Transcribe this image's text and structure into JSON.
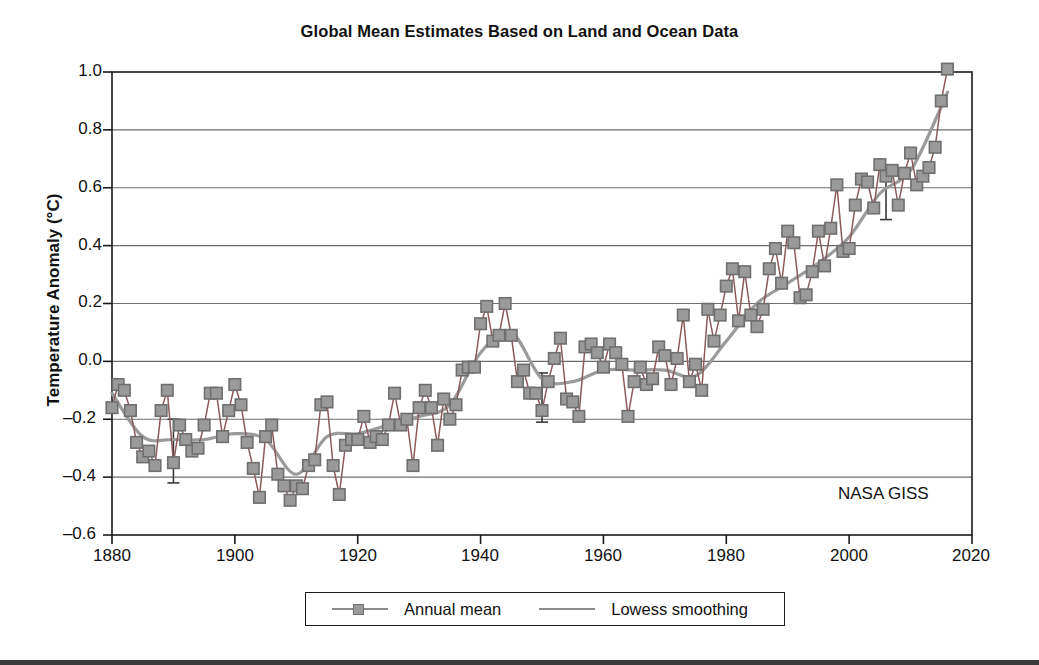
{
  "chart_data": {
    "type": "line",
    "title": "Global Mean Estimates Based on Land and Ocean Data",
    "xlabel": "",
    "ylabel": "Temperature Anomaly (°C)",
    "xlim": [
      1880,
      2020
    ],
    "ylim": [
      -0.6,
      1.0
    ],
    "xticks": [
      1880,
      1900,
      1920,
      1940,
      1960,
      1980,
      2000,
      2020
    ],
    "yticks": [
      -0.6,
      -0.4,
      -0.2,
      0.0,
      0.2,
      0.4,
      0.6,
      0.8,
      1.0
    ],
    "grid": "horizontal",
    "legend_position": "below-axes",
    "annotations": [
      {
        "text": "NASA GISS",
        "x": 2003,
        "y": -0.47
      }
    ],
    "colors": {
      "annual_line": "#8c5a5a",
      "annual_marker_fill": "#9a9a9a",
      "annual_marker_edge": "#6f6f6f",
      "lowess_line": "#9b9b9b",
      "axis": "#1a1a1a",
      "grid": "#6e6e6e",
      "text": "#111111"
    },
    "series": [
      {
        "name": "Annual mean",
        "style": "line-with-square-markers",
        "x": [
          1880,
          1881,
          1882,
          1883,
          1884,
          1885,
          1886,
          1887,
          1888,
          1889,
          1890,
          1891,
          1892,
          1893,
          1894,
          1895,
          1896,
          1897,
          1898,
          1899,
          1900,
          1901,
          1902,
          1903,
          1904,
          1905,
          1906,
          1907,
          1908,
          1909,
          1910,
          1911,
          1912,
          1913,
          1914,
          1915,
          1916,
          1917,
          1918,
          1919,
          1920,
          1921,
          1922,
          1923,
          1924,
          1925,
          1926,
          1927,
          1928,
          1929,
          1930,
          1931,
          1932,
          1933,
          1934,
          1935,
          1936,
          1937,
          1938,
          1939,
          1940,
          1941,
          1942,
          1943,
          1944,
          1945,
          1946,
          1947,
          1948,
          1949,
          1950,
          1951,
          1952,
          1953,
          1954,
          1955,
          1956,
          1957,
          1958,
          1959,
          1960,
          1961,
          1962,
          1963,
          1964,
          1965,
          1966,
          1967,
          1968,
          1969,
          1970,
          1971,
          1972,
          1973,
          1974,
          1975,
          1976,
          1977,
          1978,
          1979,
          1980,
          1981,
          1982,
          1983,
          1984,
          1985,
          1986,
          1987,
          1988,
          1989,
          1990,
          1991,
          1992,
          1993,
          1994,
          1995,
          1996,
          1997,
          1998,
          1999,
          2000,
          2001,
          2002,
          2003,
          2004,
          2005,
          2006,
          2007,
          2008,
          2009,
          2010,
          2011,
          2012,
          2013,
          2014,
          2015,
          2016
        ],
        "values": [
          -0.16,
          -0.08,
          -0.1,
          -0.17,
          -0.28,
          -0.33,
          -0.31,
          -0.36,
          -0.17,
          -0.1,
          -0.35,
          -0.22,
          -0.27,
          -0.31,
          -0.3,
          -0.22,
          -0.11,
          -0.11,
          -0.26,
          -0.17,
          -0.08,
          -0.15,
          -0.28,
          -0.37,
          -0.47,
          -0.26,
          -0.22,
          -0.39,
          -0.43,
          -0.48,
          -0.43,
          -0.44,
          -0.36,
          -0.34,
          -0.15,
          -0.14,
          -0.36,
          -0.46,
          -0.29,
          -0.27,
          -0.27,
          -0.19,
          -0.28,
          -0.26,
          -0.27,
          -0.22,
          -0.11,
          -0.22,
          -0.2,
          -0.36,
          -0.16,
          -0.1,
          -0.16,
          -0.29,
          -0.13,
          -0.2,
          -0.15,
          -0.03,
          -0.02,
          -0.02,
          0.13,
          0.19,
          0.07,
          0.09,
          0.2,
          0.09,
          -0.07,
          -0.03,
          -0.11,
          -0.11,
          -0.17,
          -0.07,
          0.01,
          0.08,
          -0.13,
          -0.14,
          -0.19,
          0.05,
          0.06,
          0.03,
          -0.02,
          0.06,
          0.03,
          -0.01,
          -0.19,
          -0.07,
          -0.02,
          -0.08,
          -0.06,
          0.05,
          0.02,
          -0.08,
          0.01,
          0.16,
          -0.07,
          -0.01,
          -0.1,
          0.18,
          0.07,
          0.16,
          0.26,
          0.32,
          0.14,
          0.31,
          0.16,
          0.12,
          0.18,
          0.32,
          0.39,
          0.27,
          0.45,
          0.41,
          0.22,
          0.23,
          0.31,
          0.45,
          0.33,
          0.46,
          0.61,
          0.38,
          0.39,
          0.54,
          0.63,
          0.62,
          0.53,
          0.68,
          0.64,
          0.66,
          0.54,
          0.65,
          0.72,
          0.61,
          0.64,
          0.67,
          0.74,
          0.9,
          1.01
        ]
      },
      {
        "name": "Lowess smoothing",
        "style": "smooth-line",
        "x": [
          1880,
          1885,
          1890,
          1895,
          1900,
          1905,
          1910,
          1915,
          1920,
          1925,
          1930,
          1935,
          1940,
          1945,
          1950,
          1955,
          1960,
          1965,
          1970,
          1975,
          1980,
          1985,
          1990,
          1995,
          2000,
          2005,
          2010,
          2015,
          2016
        ],
        "values": [
          -0.11,
          -0.26,
          -0.27,
          -0.27,
          -0.25,
          -0.27,
          -0.39,
          -0.26,
          -0.25,
          -0.22,
          -0.19,
          -0.15,
          0.03,
          0.1,
          -0.06,
          -0.07,
          -0.03,
          -0.03,
          -0.03,
          -0.05,
          0.07,
          0.2,
          0.27,
          0.34,
          0.43,
          0.58,
          0.66,
          0.88,
          0.93
        ]
      }
    ],
    "error_bars": [
      {
        "x": 1890,
        "y": -0.32,
        "lower": -0.42,
        "upper": -0.2
      },
      {
        "x": 1950,
        "y": -0.12,
        "lower": -0.21,
        "upper": -0.04
      },
      {
        "x": 2006,
        "y": 0.57,
        "lower": 0.49,
        "upper": 0.65
      }
    ]
  },
  "legend": {
    "items": [
      {
        "label": "Annual mean"
      },
      {
        "label": "Lowess smoothing"
      }
    ]
  },
  "axes": {
    "ytick_labels": [
      "1.0",
      "0.8",
      "0.6",
      "0.4",
      "0.2",
      "0.0",
      "–0.2",
      "–0.4",
      "–0.6"
    ],
    "xtick_labels": [
      "1880",
      "1900",
      "1920",
      "1940",
      "1960",
      "1980",
      "2000",
      "2020"
    ]
  }
}
